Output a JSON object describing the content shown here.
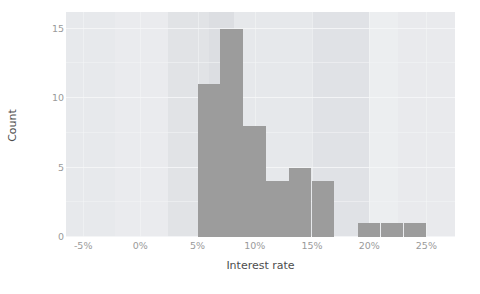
{
  "chart_data": {
    "type": "bar",
    "title": "",
    "subtitle": "",
    "xlabel": "Interest rate",
    "ylabel": "Count",
    "xlim": [
      -6.5,
      27.5
    ],
    "ylim": [
      0,
      16.2
    ],
    "grid": true,
    "legend": null,
    "xtick_labels": [
      "-5%",
      "0%",
      "5%",
      "10%",
      "15%",
      "20%",
      "25%"
    ],
    "xtick_values": [
      -5,
      0,
      5,
      10,
      15,
      20,
      25
    ],
    "ytick_labels": [
      "0",
      "5",
      "10",
      "15"
    ],
    "ytick_values": [
      0,
      5,
      10,
      15
    ],
    "bin_width": 2,
    "bins": [
      {
        "x0": 5,
        "x1": 7,
        "count": 11
      },
      {
        "x0": 7,
        "x1": 9,
        "count": 15
      },
      {
        "x0": 9,
        "x1": 11,
        "count": 8
      },
      {
        "x0": 11,
        "x1": 13,
        "count": 4
      },
      {
        "x0": 13,
        "x1": 15,
        "count": 5
      },
      {
        "x0": 15,
        "x1": 17,
        "count": 4
      },
      {
        "x0": 19,
        "x1": 21,
        "count": 1
      },
      {
        "x0": 21,
        "x1": 23,
        "count": 1
      },
      {
        "x0": 23,
        "x1": 25,
        "count": 1
      }
    ],
    "categories": [
      "5-7%",
      "7-9%",
      "9-11%",
      "11-13%",
      "13-15%",
      "15-17%",
      "19-21%",
      "21-23%",
      "23-25%"
    ],
    "values": [
      11,
      15,
      8,
      4,
      5,
      4,
      1,
      1,
      1
    ],
    "colors": {
      "bar": "#9c9c9c",
      "panel_background": "#ebecef",
      "gridline": "#f6f7f8",
      "axis_text": "#9a9a9a",
      "axis_title": "#4d4d4d",
      "page_background": "#ffffff"
    },
    "background_bands": [
      {
        "x0": -6.5,
        "x1": -2.2,
        "color": "#e7e9ec"
      },
      {
        "x0": -2.2,
        "x1": 2.4,
        "color": "#eaebee"
      },
      {
        "x0": 2.4,
        "x1": 6.0,
        "color": "#e1e3e6"
      },
      {
        "x0": 6.0,
        "x1": 8.2,
        "color": "#dcdee2"
      },
      {
        "x0": 8.2,
        "x1": 15.0,
        "color": "#e6e8eb"
      },
      {
        "x0": 15.0,
        "x1": 20.0,
        "color": "#e0e2e6"
      },
      {
        "x0": 20.0,
        "x1": 22.5,
        "color": "#eceef0"
      },
      {
        "x0": 22.5,
        "x1": 27.5,
        "color": "#e9eaed"
      }
    ]
  }
}
